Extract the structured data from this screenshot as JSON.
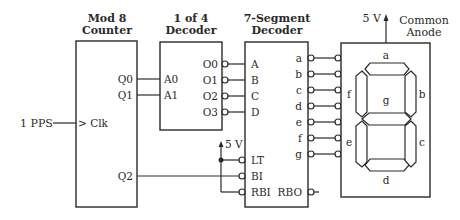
{
  "diagram": {
    "type": "circuit-schematic",
    "blocks": {
      "counter": {
        "title_line1": "Mod 8",
        "title_line2": "Counter",
        "pins": {
          "q0": "Q0",
          "q1": "Q1",
          "clk": "> Clk",
          "q2": "Q2"
        }
      },
      "decoder4": {
        "title_line1": "1 of 4",
        "title_line2": "Decoder",
        "inputs": {
          "a0": "A0",
          "a1": "A1"
        },
        "outputs": [
          "O0",
          "O1",
          "O2",
          "O3"
        ]
      },
      "seg_decoder": {
        "title_line1": "7-Segment",
        "title_line2": "Decoder",
        "inputs": [
          "A",
          "B",
          "C",
          "D"
        ],
        "outputs": [
          "a",
          "b",
          "c",
          "d",
          "e",
          "f",
          "g"
        ],
        "controls": [
          "LT",
          "BI",
          "RBI"
        ],
        "rbo": "RBO"
      },
      "display": {
        "supply": "5 V",
        "label_line1": "Common",
        "label_line2": "Anode",
        "segments": {
          "a": "a",
          "b": "b",
          "c": "c",
          "d": "d",
          "e": "e",
          "f": "f",
          "g": "g"
        }
      }
    },
    "clock_input": "1 PPS",
    "supply_label": "5 V",
    "line_color": "#2a2a2a",
    "background": "#ffffff"
  }
}
